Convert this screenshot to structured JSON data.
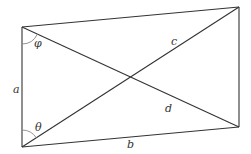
{
  "diagram": {
    "type": "parallelogram-with-diagonals",
    "vertices": {
      "top_left": [
        22,
        27
      ],
      "bottom_left": [
        22,
        147
      ],
      "top_right": [
        239,
        7
      ],
      "bottom_right": [
        239,
        127
      ]
    },
    "labels": {
      "side_a": "a",
      "side_b": "b",
      "diagonal_c": "c",
      "diagonal_d": "d",
      "angle_phi": "φ",
      "angle_theta": "θ"
    },
    "colors": {
      "line": "#333333",
      "arc": "#888888",
      "background": "#ffffff"
    }
  }
}
